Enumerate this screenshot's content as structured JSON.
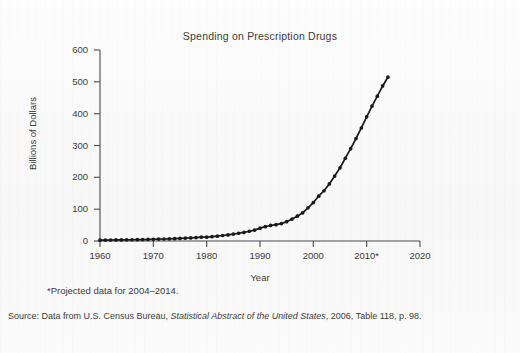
{
  "figure": {
    "title": "Spending on Prescription Drugs",
    "footnote": "*Projected data for 2004–2014.",
    "source": {
      "prefix": "Source: Data from U.S. Census Bureau, ",
      "italic": "Statistical Abstract of the United States",
      "suffix": ", 2006, Table 118, p. 98."
    },
    "ink_color": "#1a1a1a",
    "text_color": "#3a3a3a",
    "background_color": "#fbfbfb"
  },
  "chart_data": {
    "type": "line",
    "title": "Spending on Prescription Drugs",
    "xlabel": "Year",
    "ylabel": "Billions of Dollars",
    "xlim": [
      1960,
      2020
    ],
    "ylim": [
      0,
      600
    ],
    "xticks": [
      1960,
      1970,
      1980,
      1990,
      2000,
      2010,
      2020
    ],
    "xticklabels": [
      "1960",
      "1970",
      "1980",
      "1990",
      "2000",
      "2010*",
      "2020"
    ],
    "yticks": [
      0,
      100,
      200,
      300,
      400,
      500,
      600
    ],
    "yticklabels": [
      "0",
      "100",
      "200",
      "300",
      "400",
      "500",
      "600"
    ],
    "grid": false,
    "legend": null,
    "marker": "filled-circle",
    "series": [
      {
        "name": "Prescription drug spending",
        "units": "Billions of Dollars",
        "x": [
          1960,
          1961,
          1962,
          1963,
          1964,
          1965,
          1966,
          1967,
          1968,
          1969,
          1970,
          1971,
          1972,
          1973,
          1974,
          1975,
          1976,
          1977,
          1978,
          1979,
          1980,
          1981,
          1982,
          1983,
          1984,
          1985,
          1986,
          1987,
          1988,
          1989,
          1990,
          1991,
          1992,
          1993,
          1994,
          1995,
          1996,
          1997,
          1998,
          1999,
          2000,
          2001,
          2002,
          2003,
          2004,
          2005,
          2006,
          2007,
          2008,
          2009,
          2010,
          2011,
          2012,
          2013,
          2014
        ],
        "y": [
          2.7,
          2.9,
          3.1,
          3.3,
          3.5,
          3.7,
          3.9,
          4.2,
          4.5,
          4.8,
          5.5,
          5.9,
          6.3,
          6.7,
          7.3,
          8.1,
          8.9,
          9.8,
          10.8,
          12.0,
          12.0,
          13.6,
          15.3,
          17.2,
          19.2,
          21.8,
          24.3,
          26.9,
          30.6,
          34.3,
          40.3,
          45.0,
          48.8,
          51.3,
          54.6,
          60.8,
          68.9,
          77.9,
          88.5,
          104.4,
          120.8,
          140.8,
          157.9,
          179.2,
          204.0,
          230.0,
          260.0,
          290.0,
          322.0,
          355.0,
          390.0,
          424.0,
          455.0,
          487.0,
          515.0
        ]
      }
    ],
    "annotations": [
      {
        "text": "*Projected data for 2004–2014.",
        "position": "below-axis"
      }
    ]
  }
}
